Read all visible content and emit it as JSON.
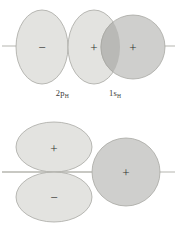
{
  "figure": {
    "colors": {
      "lobe_fill": "#e3e3e0",
      "sphere_fill": "#cfcfcd",
      "overlap_fill": "#b9b9b6",
      "outline": "#a8a8a3",
      "axis": "#b5b5b0",
      "sign_text": "#333331",
      "background": "#ffffff"
    }
  },
  "panels": [
    {
      "id": "top",
      "name": "end-on-overlap",
      "axis_y": 46,
      "signs": [
        {
          "glyph": "−",
          "x": 42,
          "y": 47,
          "lobe": "2p-left-lobe"
        },
        {
          "glyph": "+",
          "x": 94,
          "y": 47,
          "lobe": "2p-right-lobe"
        },
        {
          "glyph": "+",
          "x": 133,
          "y": 47,
          "lobe": "1s-sphere"
        }
      ],
      "shapes": {
        "p_left": {
          "cx": 42,
          "cy": 47,
          "rx": 26,
          "ry": 37
        },
        "p_right": {
          "cx": 94,
          "cy": 47,
          "rx": 26,
          "ry": 37
        },
        "s": {
          "cx": 133,
          "cy": 47,
          "r": 32
        }
      },
      "captions": [
        {
          "base": "2p",
          "sub": "H"
        },
        {
          "base": "1s",
          "sub": "H"
        }
      ]
    },
    {
      "id": "bottom",
      "name": "side-on-zero-overlap",
      "axis_y": 51,
      "signs": [
        {
          "glyph": "+",
          "x": 54,
          "y": 27,
          "lobe": "2p-upper-lobe"
        },
        {
          "glyph": "−",
          "x": 54,
          "y": 76,
          "lobe": "2p-lower-lobe"
        },
        {
          "glyph": "+",
          "x": 126,
          "y": 51,
          "lobe": "1s-sphere"
        }
      ],
      "shapes": {
        "p_upper": {
          "cx": 54,
          "cy": 26,
          "rx": 38,
          "ry": 25
        },
        "p_lower": {
          "cx": 54,
          "cy": 76,
          "rx": 38,
          "ry": 25
        },
        "s": {
          "cx": 126,
          "cy": 51,
          "r": 34
        }
      },
      "captions": [
        {
          "base": "2p",
          "sub": "H"
        },
        {
          "base": "1s",
          "sub": "H"
        }
      ]
    }
  ]
}
